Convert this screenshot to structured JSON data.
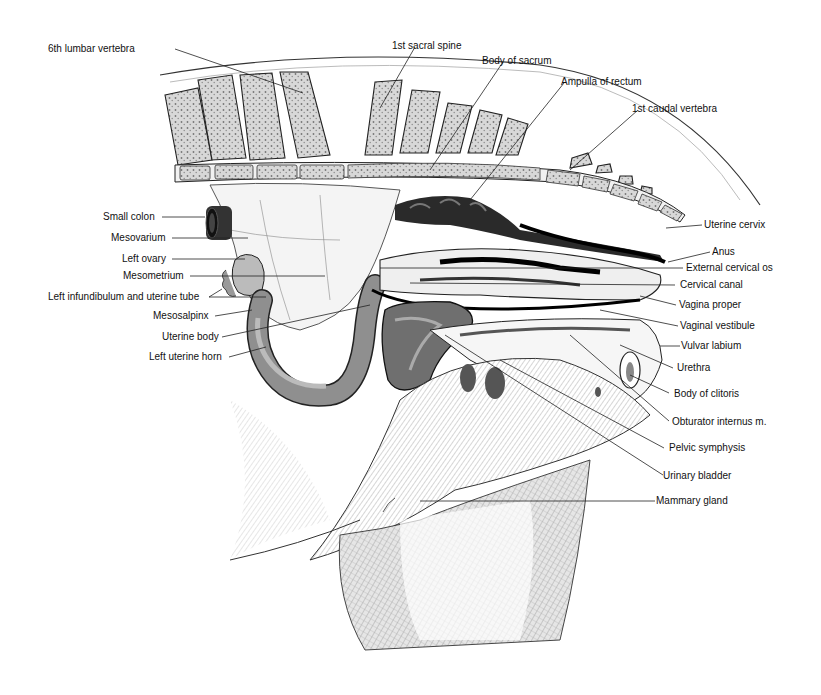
{
  "figure": {
    "labels": {
      "lumbar6": "6th lumbar vertebra",
      "sacral_spine": "1st sacral spine",
      "body_sacrum": "Body of sacrum",
      "ampulla_rectum": "Ampulla of rectum",
      "caudal1": "1st caudal vertebra",
      "small_colon": "Small colon",
      "mesovarium": "Mesovarium",
      "left_ovary": "Left ovary",
      "mesometrium": "Mesometrium",
      "infundibulum": "Left infundibulum and uterine tube",
      "mesosalpinx": "Mesosalpinx",
      "uterine_body": "Uterine body",
      "left_uterine_horn": "Left uterine horn",
      "uterine_cervix": "Uterine cervix",
      "anus": "Anus",
      "ext_cervical_os": "External cervical os",
      "cervical_canal": "Cervical canal",
      "vagina_proper": "Vagina proper",
      "vaginal_vestibule": "Vaginal vestibule",
      "vulvar_labium": "Vulvar labium",
      "urethra": "Urethra",
      "body_clitoris": "Body of clitoris",
      "obturator": "Obturator internus m.",
      "pelvic_symphysis": "Pelvic symphysis",
      "urinary_bladder": "Urinary bladder",
      "mammary_gland": "Mammary gland"
    }
  }
}
